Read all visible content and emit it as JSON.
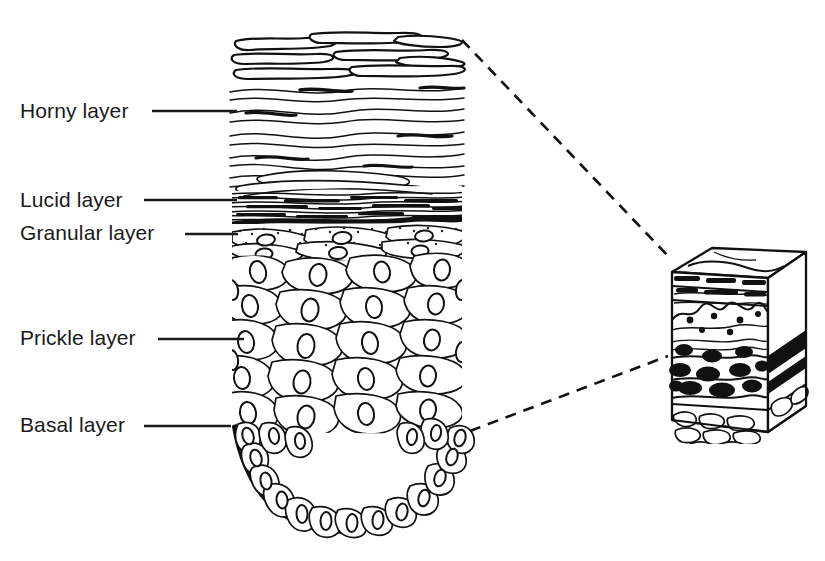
{
  "figure": {
    "background_color": "#ffffff",
    "ink_color": "#111111",
    "width": 825,
    "height": 561
  },
  "labels": [
    {
      "id": "horny",
      "text": "Horny layer",
      "x": 20,
      "y": 118,
      "leader_x1": 152,
      "leader_x2": 237,
      "leader_y": 111
    },
    {
      "id": "lucid",
      "text": "Lucid layer",
      "x": 20,
      "y": 207,
      "leader_x1": 144,
      "leader_x2": 237,
      "leader_y": 200
    },
    {
      "id": "granular",
      "text": "Granular layer",
      "x": 20,
      "y": 240,
      "leader_x1": 185,
      "leader_x2": 238,
      "leader_y": 234
    },
    {
      "id": "prickle",
      "text": "Prickle layer",
      "x": 20,
      "y": 345,
      "leader_x1": 158,
      "leader_x2": 244,
      "leader_y": 339
    },
    {
      "id": "basal",
      "text": "Basal layer",
      "x": 20,
      "y": 432,
      "leader_x1": 144,
      "leader_x2": 231,
      "leader_y": 426
    }
  ],
  "connectors": [
    {
      "id": "upper-callout",
      "x1": 462,
      "y1": 40,
      "x2": 668,
      "y2": 256
    },
    {
      "id": "lower-callout",
      "x1": 470,
      "y1": 431,
      "x2": 668,
      "y2": 356
    }
  ],
  "inset_block": {
    "id": "skin-block",
    "description": "Three-dimensional block of skin showing stratified layers in section",
    "x": 652,
    "y": 240,
    "width": 156,
    "height": 200,
    "layers": [
      "horny layer surface",
      "epidermis with rete ridges",
      "dermis with collagen",
      "deep dermis dense",
      "subcutaneous fat"
    ]
  },
  "main_diagram": {
    "id": "epidermis-section",
    "description": "Vertical histological section through the epidermis",
    "left": 232,
    "right": 462,
    "top": 28,
    "bottom": 534,
    "strata": [
      {
        "name": "Horny layer",
        "top": 28,
        "bottom": 190,
        "texture": "wavy flattened keratin squames, desquamating flakes at surface"
      },
      {
        "name": "Lucid layer",
        "top": 190,
        "bottom": 222,
        "texture": "dense dark horizontal hatching"
      },
      {
        "name": "Granular layer",
        "top": 222,
        "bottom": 258,
        "texture": "flattened stippled cells with keratohyalin granules"
      },
      {
        "name": "Prickle layer",
        "top": 258,
        "bottom": 430,
        "texture": "polygonal cells with oval nuclei"
      },
      {
        "name": "Basal layer",
        "top": 430,
        "bottom": 534,
        "texture": "single palisade row of columnar cells on basement membrane"
      }
    ]
  }
}
